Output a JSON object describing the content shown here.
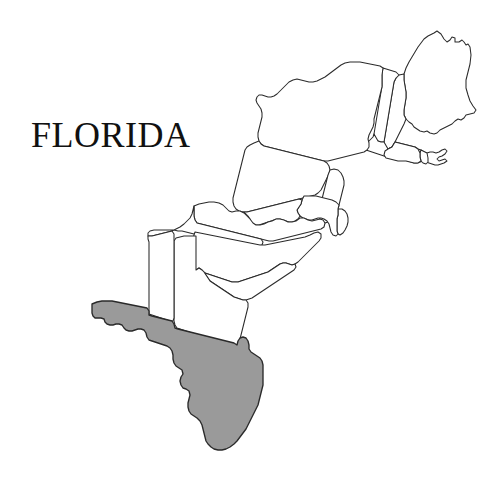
{
  "figure": {
    "title": "FLORIDA",
    "background_color": "#ffffff",
    "outline_color": "#2b2b2b",
    "highlight_color": "#9a9a9a",
    "width": 503,
    "height": 485
  },
  "map": {
    "kind": "locator-map",
    "region": "Eastern United States",
    "highlighted_state": "Florida",
    "states": [
      {
        "name": "Florida",
        "abbr": "FL",
        "highlighted": true
      },
      {
        "name": "Alabama",
        "abbr": "AL",
        "highlighted": false
      },
      {
        "name": "Georgia",
        "abbr": "GA",
        "highlighted": false
      },
      {
        "name": "South Carolina",
        "abbr": "SC",
        "highlighted": false
      },
      {
        "name": "North Carolina",
        "abbr": "NC",
        "highlighted": false
      },
      {
        "name": "Tennessee",
        "abbr": "TN",
        "highlighted": false
      },
      {
        "name": "Virginia",
        "abbr": "VA",
        "highlighted": false
      },
      {
        "name": "West Virginia",
        "abbr": "WV",
        "highlighted": false
      },
      {
        "name": "Maryland",
        "abbr": "MD",
        "highlighted": false
      },
      {
        "name": "Delaware",
        "abbr": "DE",
        "highlighted": false
      },
      {
        "name": "Pennsylvania",
        "abbr": "PA",
        "highlighted": false
      },
      {
        "name": "New Jersey",
        "abbr": "NJ",
        "highlighted": false
      },
      {
        "name": "New York",
        "abbr": "NY",
        "highlighted": false
      },
      {
        "name": "Connecticut",
        "abbr": "CT",
        "highlighted": false
      },
      {
        "name": "Rhode Island",
        "abbr": "RI",
        "highlighted": false
      },
      {
        "name": "Massachusetts",
        "abbr": "MA",
        "highlighted": false
      },
      {
        "name": "Vermont",
        "abbr": "VT",
        "highlighted": false
      },
      {
        "name": "New Hampshire",
        "abbr": "NH",
        "highlighted": false
      },
      {
        "name": "Maine",
        "abbr": "ME",
        "highlighted": false
      }
    ]
  }
}
